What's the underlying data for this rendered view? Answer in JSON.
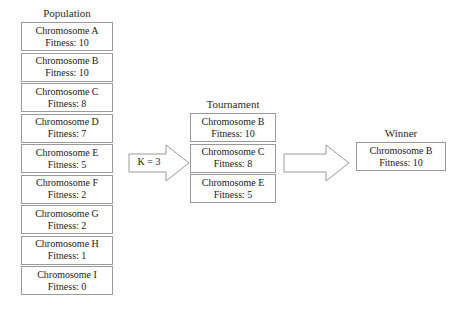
{
  "diagram": {
    "border_color": "#9a9a9a",
    "text_color": "#1a1a1a",
    "background_color": "#ffffff"
  },
  "population": {
    "heading": "Population",
    "items": [
      {
        "name": "Chromosome A",
        "fitness": "Fitness: 10"
      },
      {
        "name": "Chromosome B",
        "fitness": "Fitness: 10"
      },
      {
        "name": "Chromosome C",
        "fitness": "Fitness: 8"
      },
      {
        "name": "Chromosome D",
        "fitness": "Fitness: 7"
      },
      {
        "name": "Chromosome E",
        "fitness": "Fitness: 5"
      },
      {
        "name": "Chromosome F",
        "fitness": "Fitness: 2"
      },
      {
        "name": "Chromosome G",
        "fitness": "Fitness: 2"
      },
      {
        "name": "Chromosome H",
        "fitness": "Fitness: 1"
      },
      {
        "name": "Chromosome I",
        "fitness": "Fitness: 0"
      }
    ]
  },
  "selection_arrow": {
    "label": "K = 3",
    "icon": "block-arrow-right-icon"
  },
  "tournament": {
    "heading": "Tournament",
    "items": [
      {
        "name": "Chromosome B",
        "fitness": "Fitness: 10"
      },
      {
        "name": "Chromosome C",
        "fitness": "Fitness: 8"
      },
      {
        "name": "Chromosome E",
        "fitness": "Fitness: 5"
      }
    ]
  },
  "winner_arrow": {
    "label": "",
    "icon": "block-arrow-right-icon"
  },
  "winner": {
    "heading": "Winner",
    "items": [
      {
        "name": "Chromosome B",
        "fitness": "Fitness: 10"
      }
    ]
  }
}
